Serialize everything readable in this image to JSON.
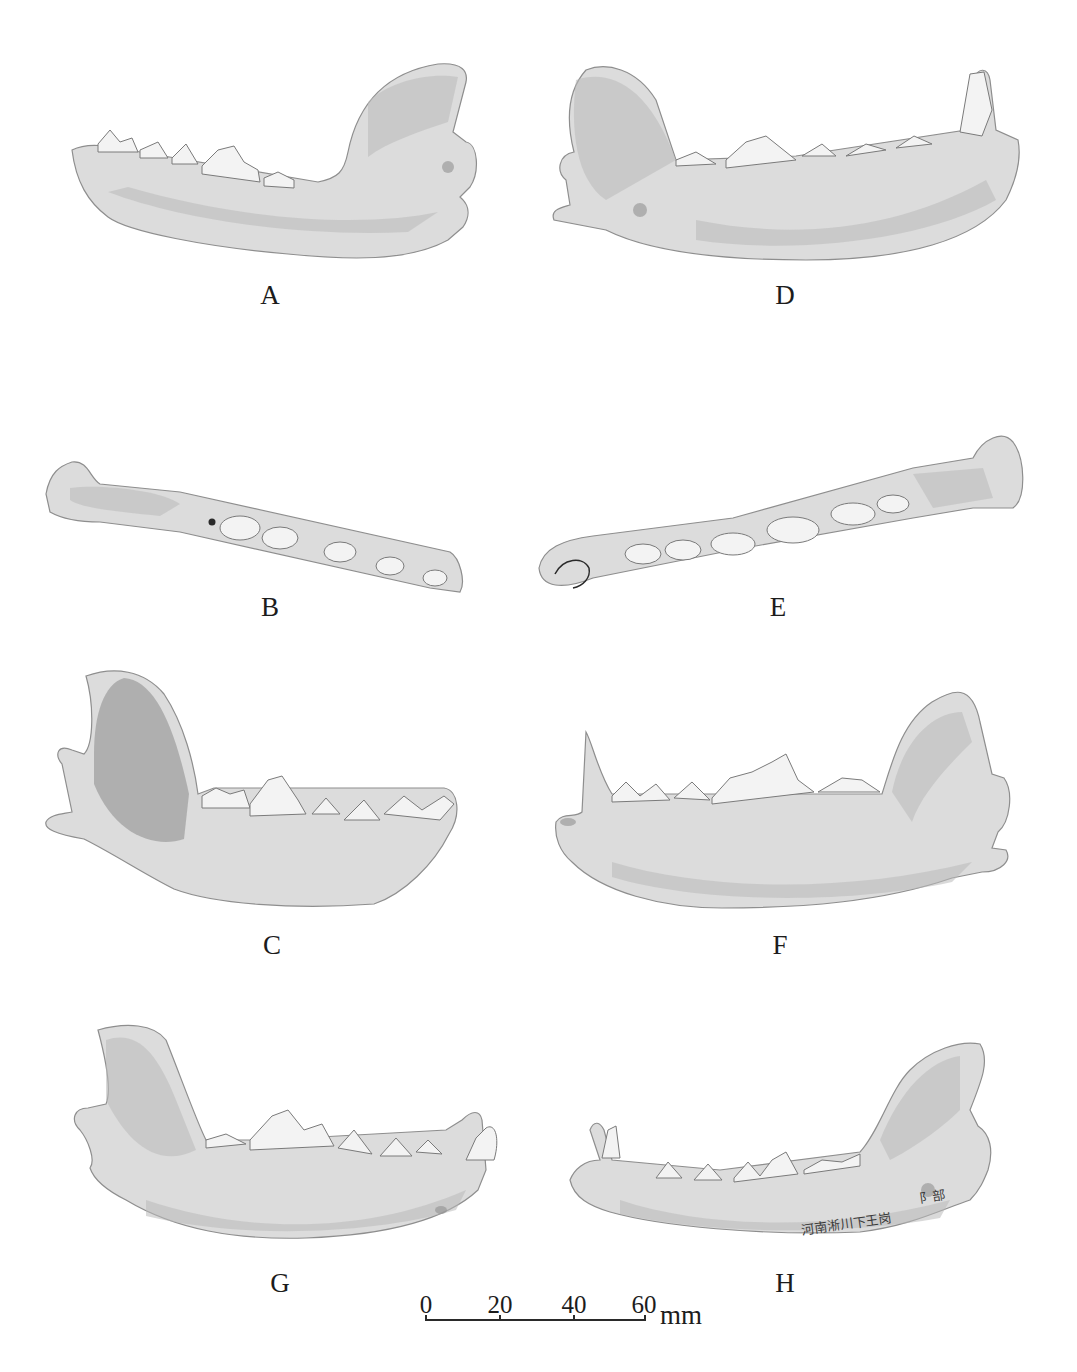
{
  "figure": {
    "panels": [
      {
        "id": "A",
        "label": "A",
        "view": "mandible-lateral-left-facing"
      },
      {
        "id": "B",
        "label": "B",
        "view": "mandible-occlusal"
      },
      {
        "id": "C",
        "label": "C",
        "view": "mandible-medial"
      },
      {
        "id": "D",
        "label": "D",
        "view": "mandible-lateral-right-facing"
      },
      {
        "id": "E",
        "label": "E",
        "view": "mandible-occlusal"
      },
      {
        "id": "F",
        "label": "F",
        "view": "mandible-lateral"
      },
      {
        "id": "G",
        "label": "G",
        "view": "mandible-medial-with-canine"
      },
      {
        "id": "H",
        "label": "H",
        "view": "mandible-lateral-with-canine"
      }
    ],
    "specimen_inscription": "河南淅川下王岗",
    "specimen_inscription_2": "阝部",
    "scale_bar": {
      "ticks": [
        "0",
        "20",
        "40",
        "60"
      ],
      "unit": "mm"
    },
    "colors": {
      "background": "#ffffff",
      "bone_light": "#dcdcdc",
      "bone_shadow": "#8a8a8a",
      "text": "#1c1c1c"
    }
  }
}
